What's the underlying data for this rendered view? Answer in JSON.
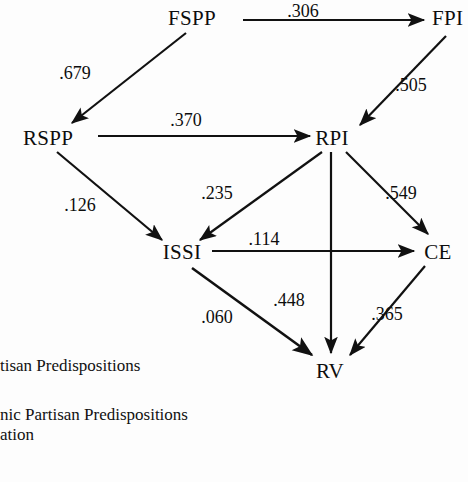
{
  "figure": {
    "type": "path-diagram",
    "background_color": "#fdfdfd",
    "ink_color": "#111111"
  },
  "nodes": [
    {
      "id": "FSPP",
      "label": "FSPP",
      "x": 192,
      "y": 25
    },
    {
      "id": "FPI",
      "label": "FPI",
      "x": 452,
      "y": 25
    },
    {
      "id": "RSPP",
      "label": "RSPP",
      "x": 48,
      "y": 138
    },
    {
      "id": "RPI",
      "label": "RPI",
      "x": 332,
      "y": 138
    },
    {
      "id": "ISSI",
      "label": "ISSI",
      "x": 182,
      "y": 255
    },
    {
      "id": "CE",
      "label": "CE",
      "x": 434,
      "y": 252
    },
    {
      "id": "RV",
      "label": "RV",
      "x": 330,
      "y": 371
    }
  ],
  "edges": [
    {
      "from": "FSPP",
      "to": "FPI",
      "coefficient": ".306",
      "label_x": 303,
      "label_y": 17
    },
    {
      "from": "FSPP",
      "to": "RSPP",
      "coefficient": ".679",
      "label_x": 75,
      "label_y": 79
    },
    {
      "from": "FPI",
      "to": "RPI",
      "coefficient": ".505",
      "label_x": 405,
      "label_y": 91
    },
    {
      "from": "RSPP",
      "to": "RPI",
      "coefficient": ".370",
      "label_x": 186,
      "label_y": 126
    },
    {
      "from": "RSPP",
      "to": "ISSI",
      "coefficient": ".126",
      "label_x": 76,
      "label_y": 211
    },
    {
      "from": "RPI",
      "to": "ISSI",
      "coefficient": ".235",
      "label_x": 215,
      "label_y": 200
    },
    {
      "from": "RPI",
      "to": "CE",
      "coefficient": ".549",
      "label_x": 396,
      "label_y": 200
    },
    {
      "from": "RPI",
      "to": "RV",
      "coefficient": ".448",
      "label_x": 287,
      "label_y": 306
    },
    {
      "from": "ISSI",
      "to": "CE",
      "coefficient": ".114",
      "label_x": 264,
      "label_y": 245
    },
    {
      "from": "ISSI",
      "to": "RV",
      "coefficient": ".060",
      "label_x": 215,
      "label_y": 323
    },
    {
      "from": "CE",
      "to": "RV",
      "coefficient": ".365",
      "label_x": 385,
      "label_y": 320
    }
  ],
  "legend": {
    "lines": [
      {
        "text": "tisan Predispositions",
        "x": 0,
        "y": 371,
        "clipped_left": true
      },
      {
        "text": "nic Partisan Predispositions",
        "x": 0,
        "y": 420,
        "clipped_left": true
      },
      {
        "text": "ation",
        "x": 0,
        "y": 440,
        "clipped_left": true
      }
    ]
  }
}
